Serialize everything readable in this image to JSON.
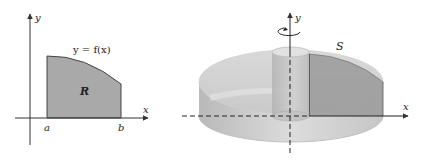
{
  "left_figure": {
    "axis_x_label": "x",
    "axis_y_label": "y",
    "curve_label": "y = f(x)",
    "region_label": "R",
    "tick_a": "a",
    "tick_b": "b"
  },
  "right_figure": {
    "axis_x_label": "x",
    "axis_y_label": "y",
    "solid_label": "S",
    "rotation_indicator": "rotation about y-axis"
  },
  "colors": {
    "region_fill": "#a9a9a9",
    "solid_light": "#d4d4d4",
    "solid_mid": "#c2c2c2",
    "solid_dark": "#8f8f8f",
    "axis": "#333333"
  }
}
